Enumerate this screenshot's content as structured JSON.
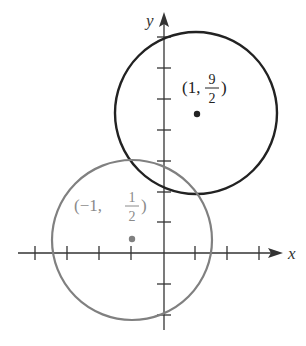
{
  "figure": {
    "x_axis_label": "x",
    "y_axis_label": "y",
    "circles": [
      {
        "name": "black-circle",
        "center": [
          1,
          4.5
        ],
        "radius": 2.6,
        "color": "#222222",
        "label": {
          "open": "(1,",
          "num": "9",
          "den": "2",
          "close": ")"
        }
      },
      {
        "name": "gray-circle",
        "center": [
          -1,
          0.5
        ],
        "radius": 2.6,
        "color": "#808080",
        "label": {
          "open": "(−1,",
          "num": "1",
          "den": "2",
          "close": ")"
        }
      }
    ]
  }
}
